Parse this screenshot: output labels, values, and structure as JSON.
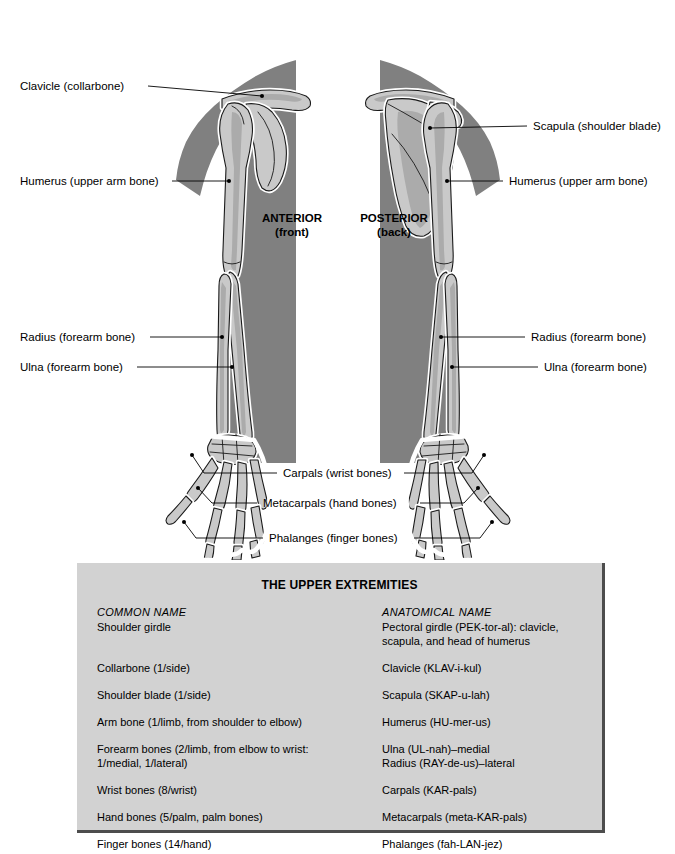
{
  "figure": {
    "orientation_labels": [
      {
        "name": "anterior",
        "line1": "ANTERIOR",
        "line2": "(front)"
      },
      {
        "name": "posterior",
        "line1": "POSTERIOR",
        "line2": "(back)"
      }
    ],
    "callouts": {
      "clavicle_left": "Clavicle (collarbone)",
      "humerus_left": "Humerus (upper arm bone)",
      "radius_left": "Radius (forearm bone)",
      "ulna_left": "Ulna (forearm bone)",
      "scapula_right": "Scapula (shoulder blade)",
      "humerus_right": "Humerus (upper arm bone)",
      "radius_right": "Radius (forearm bone)",
      "ulna_right": "Ulna (forearm bone)",
      "carpals_center": "Carpals (wrist bones)",
      "metacarpals_center": "Metacarpals (hand bones)",
      "phalanges_center": "Phalanges (finger bones)"
    },
    "colors": {
      "body": "#808080",
      "bone_fill": "#c9c9c9",
      "bone_shade": "#aeaeae",
      "bone_outline": "#1a1a1a",
      "bone_halo": "#ffffff",
      "leader_line": "#000000",
      "background": "#ffffff"
    }
  },
  "table": {
    "title": "THE UPPER EXTREMITIES",
    "columns": [
      "COMMON NAME",
      "ANATOMICAL NAME"
    ],
    "rows": [
      {
        "common": "Shoulder girdle",
        "anatomical": "Pectoral girdle (PEK-tor-al): clavicle,\nscapula, and head of humerus"
      },
      {
        "common": "Collarbone (1/side)",
        "anatomical": "Clavicle (KLAV-i-kul)"
      },
      {
        "common": "Shoulder blade (1/side)",
        "anatomical": "Scapula (SKAP-u-lah)"
      },
      {
        "common": "Arm bone (1/limb, from shoulder to elbow)",
        "anatomical": "Humerus (HU-mer-us)"
      },
      {
        "common": "Forearm bones (2/limb, from elbow to wrist:\n  1/medial, 1/lateral)",
        "anatomical": "Ulna (UL-nah)–medial\nRadius (RAY-de-us)–lateral"
      },
      {
        "common": "Wrist bones (8/wrist)",
        "anatomical": "Carpals (KAR-pals)"
      },
      {
        "common": "Hand bones (5/palm, palm bones)",
        "anatomical": "Metacarpals (meta-KAR-pals)"
      },
      {
        "common": "Finger bones (14/hand)",
        "anatomical": "Phalanges (fah-LAN-jez)"
      }
    ],
    "colors": {
      "panel_background": "#d2d2d2",
      "panel_shadow": "#4d4d4d"
    }
  }
}
